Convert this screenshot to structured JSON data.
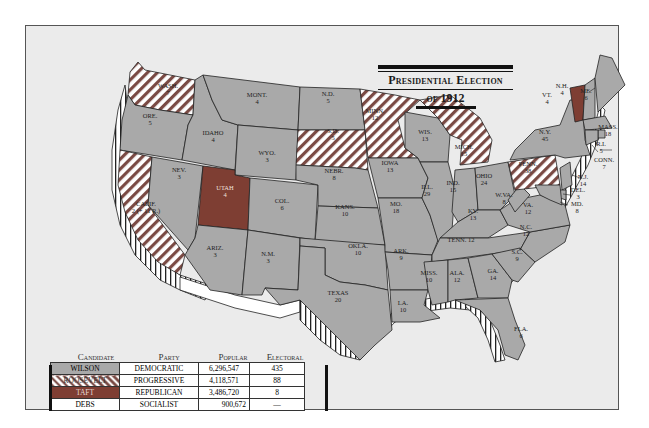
{
  "title": {
    "line1": "Presidential Election",
    "line2": "of 1912"
  },
  "colors": {
    "wilson": "#a9a9a9",
    "roosevelt_stripe_a": "#7a4a44",
    "roosevelt_stripe_b": "#ffffff",
    "taft": "#7e3e33",
    "debs": "#ffffff",
    "background": "#ebebeb"
  },
  "legend": {
    "headers": [
      "Candidate",
      "Party",
      "Popular",
      "Electoral"
    ],
    "rows": [
      {
        "candidate": "WILSON",
        "party": "DEMOCRATIC",
        "popular": "6,296,547",
        "electoral": "435",
        "fill": "wilson"
      },
      {
        "candidate": "ROOSEVELT",
        "party": "PROGRESSIVE",
        "popular": "4,118,571",
        "electoral": "88",
        "fill": "roosevelt"
      },
      {
        "candidate": "TAFT",
        "party": "REPUBLICAN",
        "popular": "3,486,720",
        "electoral": "8",
        "fill": "taft"
      },
      {
        "candidate": "DEBS",
        "party": "SOCIALIST",
        "popular": "900,672",
        "electoral": "—",
        "fill": "debs"
      }
    ]
  },
  "states": [
    {
      "name": "WASH.",
      "ev": "7",
      "winner": "roosevelt"
    },
    {
      "name": "ORE.",
      "ev": "5",
      "winner": "wilson"
    },
    {
      "name": "CALIF.",
      "ev": "2 (+ 11 R.)",
      "winner": "roosevelt"
    },
    {
      "name": "IDAHO",
      "ev": "4",
      "winner": "wilson"
    },
    {
      "name": "NEV.",
      "ev": "3",
      "winner": "wilson"
    },
    {
      "name": "MONT.",
      "ev": "4",
      "winner": "wilson"
    },
    {
      "name": "WYO.",
      "ev": "3",
      "winner": "wilson"
    },
    {
      "name": "UTAH",
      "ev": "4",
      "winner": "taft"
    },
    {
      "name": "COL.",
      "ev": "6",
      "winner": "wilson"
    },
    {
      "name": "ARIZ.",
      "ev": "3",
      "winner": "wilson"
    },
    {
      "name": "N.M.",
      "ev": "3",
      "winner": "wilson"
    },
    {
      "name": "N.D.",
      "ev": "5",
      "winner": "wilson"
    },
    {
      "name": "S.D.",
      "ev": "5",
      "winner": "roosevelt"
    },
    {
      "name": "NEBR.",
      "ev": "8",
      "winner": "wilson"
    },
    {
      "name": "KANS.",
      "ev": "10",
      "winner": "wilson"
    },
    {
      "name": "OKLA.",
      "ev": "10",
      "winner": "wilson"
    },
    {
      "name": "TEXAS",
      "ev": "20",
      "winner": "wilson"
    },
    {
      "name": "MINN.",
      "ev": "12",
      "winner": "roosevelt"
    },
    {
      "name": "IOWA",
      "ev": "13",
      "winner": "wilson"
    },
    {
      "name": "MO.",
      "ev": "18",
      "winner": "wilson"
    },
    {
      "name": "ARK.",
      "ev": "9",
      "winner": "wilson"
    },
    {
      "name": "LA.",
      "ev": "10",
      "winner": "wilson"
    },
    {
      "name": "WIS.",
      "ev": "13",
      "winner": "wilson"
    },
    {
      "name": "ILL.",
      "ev": "29",
      "winner": "wilson"
    },
    {
      "name": "MICH.",
      "ev": "15",
      "winner": "roosevelt"
    },
    {
      "name": "IND.",
      "ev": "15",
      "winner": "wilson"
    },
    {
      "name": "OHIO",
      "ev": "24",
      "winner": "wilson"
    },
    {
      "name": "KY.",
      "ev": "13",
      "winner": "wilson"
    },
    {
      "name": "TENN.",
      "ev": "12",
      "winner": "wilson"
    },
    {
      "name": "MISS.",
      "ev": "10",
      "winner": "wilson"
    },
    {
      "name": "ALA.",
      "ev": "12",
      "winner": "wilson"
    },
    {
      "name": "GA.",
      "ev": "14",
      "winner": "wilson"
    },
    {
      "name": "FLA.",
      "ev": "6",
      "winner": "wilson"
    },
    {
      "name": "S.C.",
      "ev": "9",
      "winner": "wilson"
    },
    {
      "name": "N.C.",
      "ev": "12",
      "winner": "wilson"
    },
    {
      "name": "VA.",
      "ev": "12",
      "winner": "wilson"
    },
    {
      "name": "W.VA.",
      "ev": "8",
      "winner": "wilson"
    },
    {
      "name": "PENN.",
      "ev": "38",
      "winner": "roosevelt"
    },
    {
      "name": "N.Y.",
      "ev": "45",
      "winner": "wilson"
    },
    {
      "name": "VT.",
      "ev": "4",
      "winner": "taft"
    },
    {
      "name": "N.H.",
      "ev": "4",
      "winner": "wilson"
    },
    {
      "name": "ME.",
      "ev": "6",
      "winner": "wilson"
    },
    {
      "name": "MASS.",
      "ev": "18",
      "winner": "wilson"
    },
    {
      "name": "R.I.",
      "ev": "5",
      "winner": "wilson"
    },
    {
      "name": "CONN.",
      "ev": "7",
      "winner": "wilson"
    },
    {
      "name": "N.J.",
      "ev": "14",
      "winner": "wilson"
    },
    {
      "name": "DEL.",
      "ev": "3",
      "winner": "wilson"
    },
    {
      "name": "MD.",
      "ev": "8",
      "winner": "wilson"
    }
  ]
}
